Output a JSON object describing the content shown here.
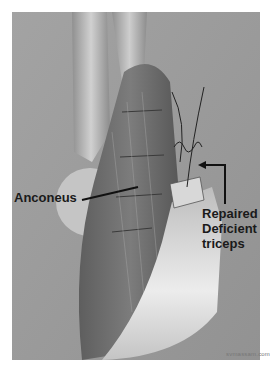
{
  "figure": {
    "labels": {
      "anconeus": "Anconeus",
      "repaired_line1": "Repaired",
      "repaired_line2": "Deficient",
      "repaired_line3": "triceps"
    },
    "credit": "svmassam.com"
  },
  "colors": {
    "background": "#9a9a9a",
    "bone": "#c8c8c8",
    "muscle_dark": "#6a6a6a",
    "tendon": "#e6e6e6",
    "label": "#1a1a1a"
  }
}
